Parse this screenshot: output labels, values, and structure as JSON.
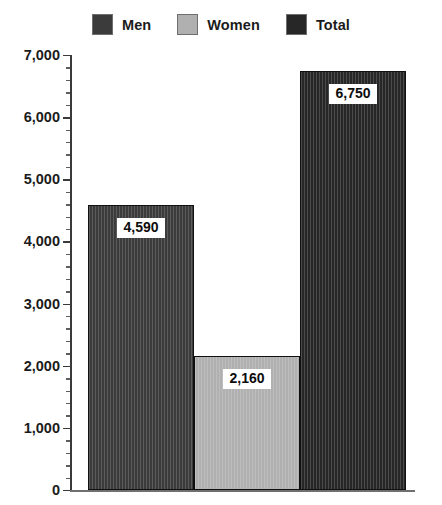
{
  "chart_data": {
    "type": "bar",
    "title": "",
    "xlabel": "",
    "ylabel": "",
    "categories": [
      "Men",
      "Women",
      "Total"
    ],
    "values": [
      4590,
      2160,
      6750
    ],
    "value_labels": [
      "4,590",
      "2,160",
      "6,750"
    ],
    "ylim": [
      0,
      7000
    ],
    "y_tick_step": 1000,
    "y_minor_step": 200,
    "grid": false,
    "legend_position": "top-center",
    "y_tick_labels": [
      "0",
      "1,000",
      "2,000",
      "3,000",
      "4,000",
      "5,000",
      "6,000",
      "7,000"
    ],
    "series": [
      {
        "name": "Men",
        "value": 4590,
        "label": "4,590",
        "color": "#3b3b3b"
      },
      {
        "name": "Women",
        "value": 2160,
        "label": "2,160",
        "color": "#b0b0b0"
      },
      {
        "name": "Total",
        "value": 6750,
        "label": "6,750",
        "color": "#272727"
      }
    ]
  },
  "legend": {
    "items": [
      {
        "label": "Men",
        "color": "#3b3b3b"
      },
      {
        "label": "Women",
        "color": "#b0b0b0"
      },
      {
        "label": "Total",
        "color": "#272727"
      }
    ]
  },
  "colors": {
    "men": "#3b3b3b",
    "women": "#b0b0b0",
    "total": "#272727",
    "axis": "#3a3a3a",
    "text": "#1b1b1b",
    "background": "#ffffff"
  }
}
